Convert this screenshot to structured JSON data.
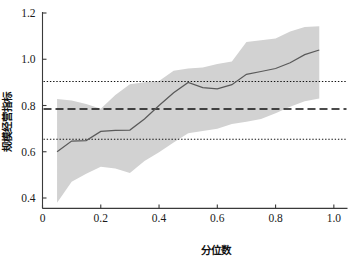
{
  "chart_data": {
    "type": "line",
    "title": "",
    "xlabel": "分位数",
    "ylabel": "规模经营指标",
    "xlim": [
      0.0,
      1.04
    ],
    "ylim": [
      0.33,
      1.22
    ],
    "grid": false,
    "legend": "none",
    "xticks": [
      0,
      0.2,
      0.4,
      0.6,
      0.8,
      1.0
    ],
    "xtick_labels": [
      "0",
      "0.2",
      "0.4",
      "0.6",
      "0.8",
      "1.0"
    ],
    "yticks": [
      0.4,
      0.6,
      0.8,
      1.0,
      1.2
    ],
    "ytick_labels": [
      "0.4",
      "0.6",
      "0.8",
      "1.0",
      "1.2"
    ],
    "x": [
      0.05,
      0.1,
      0.15,
      0.2,
      0.25,
      0.3,
      0.35,
      0.4,
      0.45,
      0.5,
      0.55,
      0.6,
      0.65,
      0.7,
      0.75,
      0.8,
      0.85,
      0.9,
      0.95
    ],
    "series": [
      {
        "name": "分位数回归系数",
        "style": "solid",
        "color": "#5a5a5a",
        "values": [
          0.6,
          0.646,
          0.648,
          0.688,
          0.692,
          0.694,
          0.742,
          0.8,
          0.855,
          0.9,
          0.877,
          0.872,
          0.89,
          0.935,
          0.947,
          0.96,
          0.985,
          1.02,
          1.04
        ]
      }
    ],
    "band": {
      "name": "95%置信区间",
      "color": "#d2d2d2",
      "upper": [
        0.828,
        0.822,
        0.806,
        0.786,
        0.845,
        0.892,
        0.9,
        0.906,
        0.95,
        0.96,
        0.964,
        0.98,
        0.99,
        1.075,
        1.082,
        1.09,
        1.12,
        1.14,
        1.143
      ],
      "lower": [
        0.38,
        0.47,
        0.505,
        0.535,
        0.528,
        0.508,
        0.56,
        0.598,
        0.64,
        0.68,
        0.69,
        0.7,
        0.72,
        0.73,
        0.742,
        0.766,
        0.795,
        0.818,
        0.83
      ]
    },
    "reference_lines": [
      {
        "name": "ols-estimate",
        "style": "dashed",
        "value": 0.785,
        "color": "#111111"
      },
      {
        "name": "ols-upper-bound",
        "style": "dotted",
        "value": 0.904,
        "color": "#111111"
      },
      {
        "name": "ols-lower-bound",
        "style": "dotted",
        "value": 0.654,
        "color": "#111111"
      }
    ]
  }
}
